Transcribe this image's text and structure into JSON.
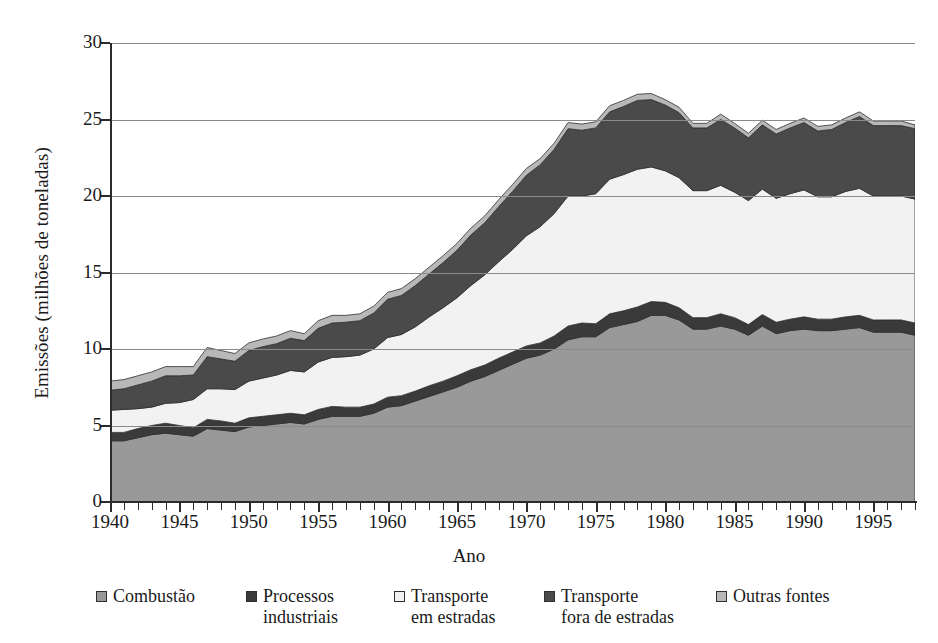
{
  "chart_data": {
    "type": "area",
    "stacked": true,
    "title": "",
    "xlabel": "Ano",
    "ylabel": "Emissões (milhões de toneladas)",
    "ylim": [
      0,
      30
    ],
    "xlim": [
      1940,
      1998
    ],
    "ytick_labels": [
      "0",
      "5",
      "10",
      "15",
      "20",
      "25",
      "30"
    ],
    "ytick_values": [
      0,
      5,
      10,
      15,
      20,
      25,
      30
    ],
    "xtick_labels": [
      "1940",
      "1945",
      "1950",
      "1955",
      "1960",
      "1965",
      "1970",
      "1975",
      "1980",
      "1985",
      "1990",
      "1995"
    ],
    "xtick_values": [
      1940,
      1945,
      1950,
      1955,
      1960,
      1965,
      1970,
      1975,
      1980,
      1985,
      1990,
      1995
    ],
    "minor_ticks": "every year",
    "grid": "horizontal",
    "legend_position": "bottom",
    "x": [
      1940,
      1941,
      1942,
      1943,
      1944,
      1945,
      1946,
      1947,
      1948,
      1949,
      1950,
      1951,
      1952,
      1953,
      1954,
      1955,
      1956,
      1957,
      1958,
      1959,
      1960,
      1961,
      1962,
      1963,
      1964,
      1965,
      1966,
      1967,
      1968,
      1969,
      1970,
      1971,
      1972,
      1973,
      1974,
      1975,
      1976,
      1977,
      1978,
      1979,
      1980,
      1981,
      1982,
      1983,
      1984,
      1985,
      1986,
      1987,
      1988,
      1989,
      1990,
      1991,
      1992,
      1993,
      1994,
      1995,
      1996,
      1997,
      1998
    ],
    "series": [
      {
        "name": "Combustão",
        "color": "#999999",
        "values": [
          4.0,
          4.0,
          4.2,
          4.4,
          4.5,
          4.4,
          4.3,
          4.8,
          4.7,
          4.6,
          4.9,
          5.0,
          5.1,
          5.2,
          5.1,
          5.4,
          5.6,
          5.6,
          5.6,
          5.8,
          6.2,
          6.3,
          6.6,
          6.9,
          7.2,
          7.5,
          7.9,
          8.2,
          8.6,
          9.0,
          9.4,
          9.6,
          10.0,
          10.6,
          10.8,
          10.8,
          11.4,
          11.6,
          11.8,
          12.2,
          12.2,
          11.9,
          11.3,
          11.3,
          11.5,
          11.3,
          10.9,
          11.5,
          11.0,
          11.2,
          11.3,
          11.2,
          11.2,
          11.3,
          11.4,
          11.1,
          11.1,
          11.1,
          10.9
        ]
      },
      {
        "name": "Processos industriais",
        "color": "#3a3a3a",
        "values": [
          0.55,
          0.55,
          0.6,
          0.6,
          0.65,
          0.6,
          0.55,
          0.6,
          0.6,
          0.55,
          0.6,
          0.6,
          0.6,
          0.6,
          0.6,
          0.65,
          0.65,
          0.6,
          0.6,
          0.6,
          0.65,
          0.65,
          0.65,
          0.7,
          0.7,
          0.75,
          0.75,
          0.75,
          0.8,
          0.8,
          0.8,
          0.8,
          0.85,
          0.9,
          0.9,
          0.85,
          0.9,
          0.9,
          0.95,
          0.9,
          0.85,
          0.8,
          0.75,
          0.75,
          0.8,
          0.75,
          0.7,
          0.75,
          0.75,
          0.75,
          0.8,
          0.75,
          0.75,
          0.8,
          0.8,
          0.8,
          0.8,
          0.8,
          0.8
        ]
      },
      {
        "name": "Transporte em estradas",
        "color": "#f2f2f2",
        "values": [
          1.45,
          1.5,
          1.3,
          1.2,
          1.3,
          1.5,
          1.85,
          2.0,
          2.1,
          2.2,
          2.4,
          2.5,
          2.6,
          2.8,
          2.8,
          3.1,
          3.2,
          3.3,
          3.4,
          3.6,
          3.9,
          4.0,
          4.2,
          4.5,
          4.8,
          5.1,
          5.5,
          5.9,
          6.3,
          6.7,
          7.2,
          7.6,
          8.0,
          8.5,
          8.3,
          8.5,
          8.8,
          8.9,
          9.0,
          8.8,
          8.6,
          8.5,
          8.3,
          8.3,
          8.4,
          8.2,
          8.1,
          8.2,
          8.1,
          8.2,
          8.3,
          8.0,
          8.0,
          8.2,
          8.3,
          8.1,
          8.1,
          8.1,
          8.1
        ]
      },
      {
        "name": "Transporte fora de estradas",
        "color": "#4a4a4a",
        "values": [
          1.3,
          1.35,
          1.55,
          1.7,
          1.8,
          1.75,
          1.6,
          2.1,
          1.95,
          1.85,
          2.0,
          2.05,
          2.05,
          2.1,
          2.05,
          2.2,
          2.25,
          2.25,
          2.25,
          2.35,
          2.5,
          2.55,
          2.7,
          2.8,
          2.95,
          3.1,
          3.3,
          3.4,
          3.6,
          3.8,
          3.95,
          4.05,
          4.2,
          4.4,
          4.3,
          4.3,
          4.4,
          4.45,
          4.5,
          4.4,
          4.3,
          4.25,
          4.1,
          4.1,
          4.3,
          4.2,
          4.1,
          4.2,
          4.2,
          4.3,
          4.4,
          4.3,
          4.4,
          4.5,
          4.7,
          4.6,
          4.6,
          4.6,
          4.6
        ]
      },
      {
        "name": "Outras fontes",
        "color": "#b8b8b8",
        "values": [
          0.6,
          0.6,
          0.6,
          0.6,
          0.6,
          0.6,
          0.55,
          0.6,
          0.55,
          0.5,
          0.5,
          0.5,
          0.5,
          0.5,
          0.45,
          0.5,
          0.5,
          0.45,
          0.45,
          0.45,
          0.45,
          0.45,
          0.45,
          0.45,
          0.45,
          0.45,
          0.45,
          0.45,
          0.45,
          0.45,
          0.45,
          0.4,
          0.4,
          0.4,
          0.4,
          0.4,
          0.4,
          0.4,
          0.4,
          0.4,
          0.35,
          0.35,
          0.3,
          0.3,
          0.35,
          0.3,
          0.3,
          0.3,
          0.3,
          0.3,
          0.3,
          0.3,
          0.3,
          0.3,
          0.3,
          0.3,
          0.3,
          0.3,
          0.25
        ]
      }
    ],
    "totals": [
      7.9,
      8.0,
      8.25,
      8.5,
      8.85,
      8.85,
      8.85,
      10.1,
      9.9,
      9.7,
      10.4,
      10.65,
      10.85,
      11.2,
      11.0,
      11.85,
      12.2,
      12.2,
      12.3,
      12.8,
      13.7,
      13.95,
      14.6,
      15.35,
      16.1,
      16.9,
      17.9,
      18.7,
      19.75,
      20.75,
      21.8,
      22.45,
      23.45,
      24.8,
      24.7,
      24.85,
      25.9,
      26.25,
      26.65,
      26.7,
      26.3,
      25.8,
      24.75,
      24.75,
      25.35,
      24.75,
      24.1,
      24.95,
      24.35,
      24.75,
      25.1,
      24.55,
      24.65,
      25.1,
      25.5,
      24.9,
      24.9,
      24.9,
      24.65
    ]
  },
  "axes": {
    "y_title": "Emissões (milhões de toneladas)",
    "x_title": "Ano"
  },
  "legend": {
    "items": [
      {
        "label_line1": "Combustão",
        "label_line2": "",
        "color": "#999999",
        "name": "combustao"
      },
      {
        "label_line1": "Processos",
        "label_line2": "industriais",
        "color": "#3a3a3a",
        "name": "processos-industriais"
      },
      {
        "label_line1": "Transporte",
        "label_line2": "em estradas",
        "color": "#f2f2f2",
        "name": "transporte-em-estradas"
      },
      {
        "label_line1": "Transporte",
        "label_line2": "fora de estradas",
        "color": "#4a4a4a",
        "name": "transporte-fora-de-estradas"
      },
      {
        "label_line1": "Outras fontes",
        "label_line2": "",
        "color": "#b8b8b8",
        "name": "outras-fontes"
      }
    ]
  }
}
